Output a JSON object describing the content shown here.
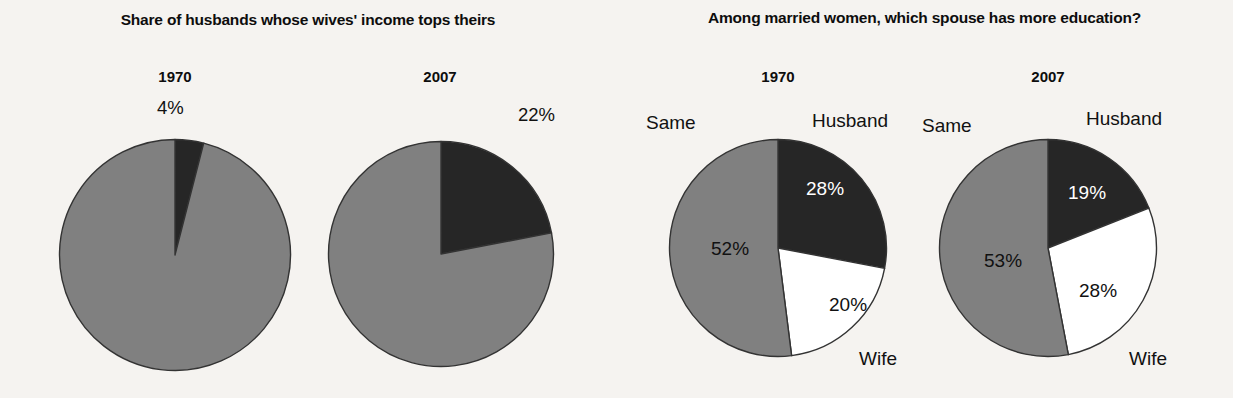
{
  "panels": [
    {
      "title": "Share of husbands whose wives' income tops theirs",
      "charts": [
        {
          "year": "1970",
          "callout": "4%",
          "slices": [
            {
              "name": "wives-income-tops",
              "value": 4,
              "color": "#262626"
            },
            {
              "name": "other",
              "value": 96,
              "color": "#808080"
            }
          ]
        },
        {
          "year": "2007",
          "callout": "22%",
          "slices": [
            {
              "name": "wives-income-tops",
              "value": 22,
              "color": "#262626"
            },
            {
              "name": "other",
              "value": 78,
              "color": "#808080"
            }
          ]
        }
      ]
    },
    {
      "title": "Among married women, which spouse has more education?",
      "charts": [
        {
          "year": "1970",
          "labels": {
            "same": "Same",
            "husband": "Husband",
            "wife": "Wife"
          },
          "slices": [
            {
              "name": "husband",
              "value": 28,
              "display": "28%",
              "color": "#262626"
            },
            {
              "name": "wife",
              "value": 20,
              "display": "20%",
              "color": "#ffffff"
            },
            {
              "name": "same",
              "value": 52,
              "display": "52%",
              "color": "#808080"
            }
          ]
        },
        {
          "year": "2007",
          "labels": {
            "same": "Same",
            "husband": "Husband",
            "wife": "Wife"
          },
          "slices": [
            {
              "name": "husband",
              "value": 19,
              "display": "19%",
              "color": "#262626"
            },
            {
              "name": "wife",
              "value": 28,
              "display": "28%",
              "color": "#ffffff"
            },
            {
              "name": "same",
              "value": 53,
              "display": "53%",
              "color": "#808080"
            }
          ]
        }
      ]
    }
  ],
  "chart_data": [
    {
      "type": "pie",
      "title": "Share of husbands whose wives' income tops theirs",
      "subtitle": "1970",
      "categories": [
        "Wives' income tops husband's",
        "Other"
      ],
      "values": [
        4,
        96
      ],
      "labels": [
        "4%",
        ""
      ],
      "colors": [
        "#262626",
        "#808080"
      ],
      "start_angle_deg": 0,
      "direction": "clockwise",
      "legend": "none"
    },
    {
      "type": "pie",
      "title": "Share of husbands whose wives' income tops theirs",
      "subtitle": "2007",
      "categories": [
        "Wives' income tops husband's",
        "Other"
      ],
      "values": [
        22,
        78
      ],
      "labels": [
        "22%",
        ""
      ],
      "colors": [
        "#262626",
        "#808080"
      ],
      "start_angle_deg": 0,
      "direction": "clockwise",
      "legend": "none"
    },
    {
      "type": "pie",
      "title": "Among married women, which spouse has more education?",
      "subtitle": "1970",
      "categories": [
        "Husband",
        "Wife",
        "Same"
      ],
      "values": [
        28,
        20,
        52
      ],
      "labels": [
        "28%",
        "20%",
        "52%"
      ],
      "colors": [
        "#262626",
        "#ffffff",
        "#808080"
      ],
      "start_angle_deg": 0,
      "direction": "clockwise",
      "legend": "outside-labels"
    },
    {
      "type": "pie",
      "title": "Among married women, which spouse has more education?",
      "subtitle": "2007",
      "categories": [
        "Husband",
        "Wife",
        "Same"
      ],
      "values": [
        19,
        28,
        53
      ],
      "labels": [
        "19%",
        "28%",
        "53%"
      ],
      "colors": [
        "#262626",
        "#ffffff",
        "#808080"
      ],
      "start_angle_deg": 0,
      "direction": "clockwise",
      "legend": "outside-labels"
    }
  ],
  "style": {
    "background": "#f5f3f0",
    "dark": "#262626",
    "gray": "#808080",
    "white": "#ffffff",
    "stroke": "#333333"
  }
}
